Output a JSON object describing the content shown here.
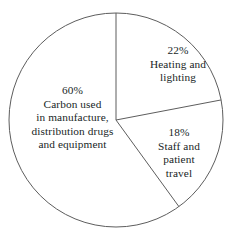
{
  "chart_data": {
    "type": "pie",
    "title": "",
    "subtitle": "",
    "xlabel": "",
    "ylabel": "",
    "legend_position": "none",
    "grid": false,
    "units": "percent",
    "total": 100,
    "start_angle_deg": 0,
    "direction": "clockwise",
    "categories": [
      "Carbon used in manufacture, distribution drugs and equipment",
      "Heating and lighting",
      "Staff and patient travel"
    ],
    "values": [
      60,
      22,
      18
    ],
    "slices": [
      {
        "id": "carbon",
        "percent_text": "60%",
        "value": 60,
        "label_lines": [
          "Carbon used",
          "in manufacture,",
          "distribution drugs",
          "and equipment"
        ],
        "start_angle_deg": 144,
        "end_angle_deg": 360,
        "fill": "#ffffff",
        "stroke": "#5d5d5d"
      },
      {
        "id": "heating",
        "percent_text": "22%",
        "value": 22,
        "label_lines": [
          "Heating and",
          "lighting"
        ],
        "start_angle_deg": 0,
        "end_angle_deg": 79.2,
        "fill": "#ffffff",
        "stroke": "#5d5d5d"
      },
      {
        "id": "travel",
        "percent_text": "18%",
        "value": 18,
        "label_lines": [
          "Staff and",
          "patient",
          "travel"
        ],
        "start_angle_deg": 79.2,
        "end_angle_deg": 144,
        "fill": "#ffffff",
        "stroke": "#5d5d5d"
      }
    ],
    "geometry": {
      "center_x": 116,
      "center_y": 120,
      "radius": 107
    },
    "colors": {
      "background": "#ffffff",
      "stroke": "#5d5d5d",
      "text": "#201f1f"
    }
  }
}
